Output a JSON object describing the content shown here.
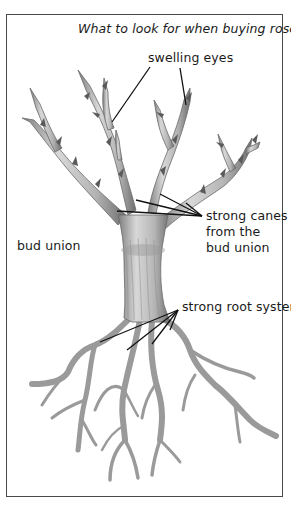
{
  "figure": {
    "title": "What to look for when buying roses",
    "labels": {
      "swelling_eyes": "swelling eyes",
      "strong_canes_line1": "strong canes",
      "strong_canes_line2": "from the",
      "strong_canes_line3": "bud union",
      "bud_union": "bud union",
      "strong_root_system": "strong root system"
    },
    "colors": {
      "border": "#4a4a4a",
      "leader_lines": "#111111",
      "bark_fill": "#c9c9c9",
      "bark_shade": "#8a8a8a",
      "text": "#1a1a1a"
    }
  }
}
